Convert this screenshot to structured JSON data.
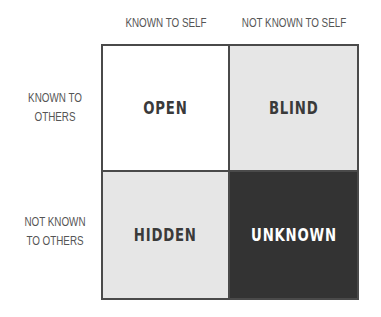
{
  "columns": [
    {
      "label": "KNOWN TO SELF"
    },
    {
      "label": "NOT KNOWN TO SELF"
    }
  ],
  "rows": [
    {
      "line1": "KNOWN TO",
      "line2": "OTHERS"
    },
    {
      "line1": "NOT KNOWN",
      "line2": "TO OTHERS"
    }
  ],
  "quadrants": [
    {
      "label": "OPEN",
      "fill": "#ffffff",
      "text_color": "#3a3a3a"
    },
    {
      "label": "BLIND",
      "fill": "#e6e6e6",
      "text_color": "#3a3a3a"
    },
    {
      "label": "HIDDEN",
      "fill": "#e6e6e6",
      "text_color": "#3a3a3a"
    },
    {
      "label": "UNKNOWN",
      "fill": "#333333",
      "text_color": "#ffffff"
    }
  ],
  "colors": {
    "border": "#4a4a4a",
    "label_text": "#555555"
  }
}
